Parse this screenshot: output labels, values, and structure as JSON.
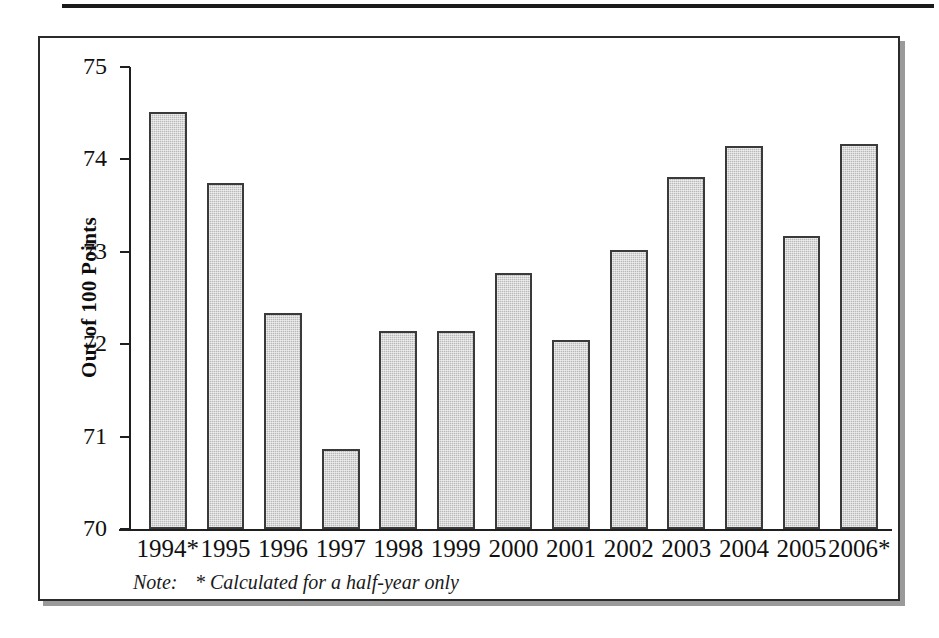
{
  "figure": {
    "note_label": "Note:",
    "note_text": "* Calculated for a half-year only"
  },
  "chart_data": {
    "type": "bar",
    "title": "",
    "xlabel": "",
    "ylabel": "Out of 100 Points",
    "ylim": [
      70,
      75
    ],
    "yticks": [
      "70",
      "71",
      "72",
      "73",
      "74",
      "75"
    ],
    "grid": false,
    "legend": null,
    "categories": [
      "1994*",
      "1995",
      "1996",
      "1997",
      "1998",
      "1999",
      "2000",
      "2001",
      "2002",
      "2003",
      "2004",
      "2005",
      "2006*"
    ],
    "values": [
      74.51,
      73.75,
      72.34,
      70.87,
      72.14,
      72.14,
      72.77,
      72.05,
      73.02,
      73.81,
      74.14,
      73.17,
      74.17
    ],
    "bar_color": "#b9b9b9",
    "bar_edge_color": "#3a3a3a",
    "annotations": [
      "* Calculated for a half-year only"
    ]
  }
}
